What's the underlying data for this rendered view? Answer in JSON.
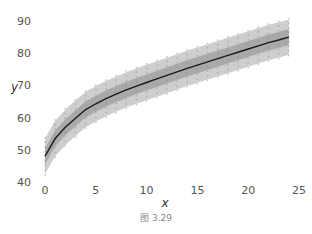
{
  "caption": "图 3.29",
  "colors": {
    "mean_line": "#1a1a1a",
    "outer_band": "#bdbdbd",
    "inner_band": "#9a9a9a",
    "points": "#8c8c8c",
    "tick_text": "#555555"
  },
  "chart_data": {
    "type": "line",
    "title": "",
    "xlabel": "x",
    "ylabel": "y",
    "xlim": [
      -0.5,
      25
    ],
    "ylim": [
      40,
      92
    ],
    "xticks": [
      0,
      5,
      10,
      15,
      20,
      25
    ],
    "yticks": [
      40,
      50,
      60,
      70,
      80,
      90
    ],
    "grid": false,
    "legend": null,
    "x": [
      0,
      1,
      2,
      3,
      4,
      5,
      6,
      7,
      8,
      9,
      10,
      11,
      12,
      13,
      14,
      15,
      16,
      17,
      18,
      19,
      20,
      21,
      22,
      23,
      24
    ],
    "series": [
      {
        "name": "mean",
        "values": [
          48.0,
          53.5,
          57.0,
          59.8,
          62.5,
          64.3,
          65.9,
          67.3,
          68.6,
          69.8,
          70.9,
          72.0,
          73.1,
          74.2,
          75.3,
          76.3,
          77.3,
          78.3,
          79.3,
          80.3,
          81.3,
          82.3,
          83.3,
          84.1,
          85.0
        ]
      },
      {
        "name": "inner band",
        "lower": [
          45.5,
          51.0,
          54.5,
          57.3,
          60.0,
          61.8,
          63.4,
          64.8,
          66.1,
          67.3,
          68.4,
          69.5,
          70.6,
          71.7,
          72.8,
          73.8,
          74.8,
          75.8,
          76.8,
          77.8,
          78.8,
          79.8,
          80.8,
          81.6,
          82.5
        ],
        "upper": [
          50.5,
          56.0,
          59.5,
          62.3,
          65.0,
          66.8,
          68.4,
          69.8,
          71.1,
          72.3,
          73.4,
          74.5,
          75.6,
          76.7,
          77.8,
          78.8,
          79.8,
          80.8,
          81.8,
          82.8,
          83.8,
          84.8,
          85.8,
          86.6,
          87.5
        ]
      },
      {
        "name": "outer band",
        "lower": [
          42.5,
          48.0,
          51.5,
          54.3,
          57.0,
          58.8,
          60.4,
          61.8,
          63.1,
          64.3,
          65.4,
          66.5,
          67.6,
          68.7,
          69.8,
          70.8,
          71.8,
          72.8,
          73.8,
          74.8,
          75.8,
          76.8,
          77.8,
          78.6,
          79.5
        ],
        "upper": [
          53.5,
          59.0,
          62.5,
          65.3,
          68.0,
          69.8,
          71.4,
          72.8,
          74.1,
          75.3,
          76.4,
          77.5,
          78.6,
          79.7,
          80.8,
          81.8,
          82.8,
          83.8,
          84.8,
          85.8,
          86.8,
          87.8,
          88.8,
          89.6,
          90.5
        ]
      }
    ]
  }
}
